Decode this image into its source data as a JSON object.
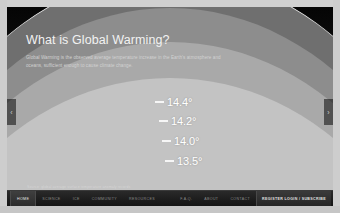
{
  "slide": {
    "title": "What is Global Warming?",
    "description": "Global Warming is the observed average temperature increase in the Earth's atmosphere and oceans, sufficient enough to cause climate change.",
    "caption": "Source: global average surface temperature anomaly records",
    "temperatures": [
      {
        "value": "14.4°",
        "band_color": "#6f6f6f"
      },
      {
        "value": "14.2°",
        "band_color": "#8d8d8d"
      },
      {
        "value": "14.0°",
        "band_color": "#a9a9a9"
      },
      {
        "value": "13.5°",
        "band_color": "#c3c3c3"
      }
    ]
  },
  "carousel": {
    "prev_label": "‹",
    "next_label": "›"
  },
  "toolbar": {
    "left_items": [
      {
        "label": "HOME",
        "active": true
      },
      {
        "label": "SCIENCE",
        "active": false
      },
      {
        "label": "ICE",
        "active": false
      },
      {
        "label": "COMMUNITY",
        "active": false
      },
      {
        "label": "RESOURCES",
        "active": false
      }
    ],
    "right_items": [
      {
        "label": "F.A.Q.",
        "active": false
      },
      {
        "label": "ABOUT",
        "active": false
      },
      {
        "label": "CONTACT",
        "active": false
      }
    ],
    "cta": {
      "label": "REGISTER LOGIN / SUBSCRIBE"
    }
  },
  "colors": {
    "slide_background": "#0c0c0c",
    "page_background": "#cccccc",
    "toolbar_background": "#1d1d1d",
    "text_primary": "#f2f2f2",
    "text_secondary": "#d2d2d2"
  }
}
